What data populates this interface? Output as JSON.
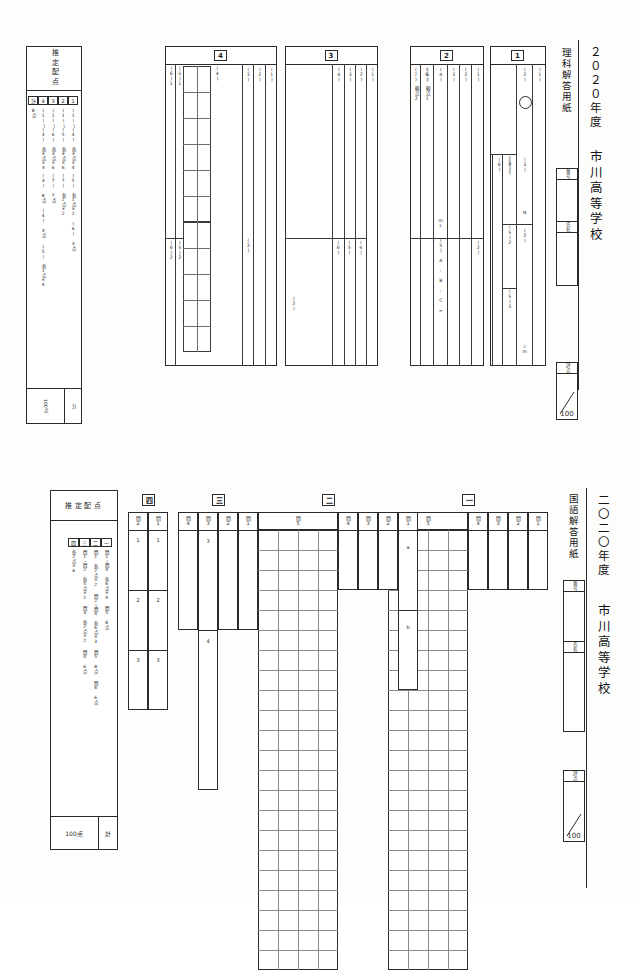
{
  "meta": {
    "bg_color": "#fdfdfc",
    "ink_color": "#2b2b2b",
    "rule_color": "#6e6e6e"
  },
  "science_sheet": {
    "year": "２０２０年度",
    "subject_title": "理科解答用紙",
    "school": "市川高等学校",
    "fields": {
      "number_label": "番号",
      "name_label": "氏名",
      "score_label": "評点",
      "score_denominator": "100"
    },
    "haiten": {
      "title": "推定配点",
      "total_label": "計",
      "total_value": "100点",
      "columns": [
        {
          "sec": "1",
          "lines": [
            "(1)～(4)  各3点×4",
            "(5)  各1点×2",
            "(6)  3点"
          ]
        },
        {
          "sec": "2",
          "lines": [
            "(1)～(5)  各3点×6",
            "(7)  各2点×2"
          ]
        },
        {
          "sec": "3",
          "lines": [
            "(1)～(6)  各3点×6",
            "(7)  7点"
          ]
        },
        {
          "sec": "4",
          "lines": [
            "(1)～(3)  各3点×3",
            "(3)  8点",
            "(4)  3点",
            "(5)  各1点×4"
          ]
        },
        {
          "sec": "計",
          "lines": [
            "8点"
          ]
        }
      ]
    },
    "sections": [
      {
        "id": "1",
        "badge": "1",
        "rows": [
          {
            "label": "(1)",
            "sub": []
          },
          {
            "label": "(2)",
            "sub": [],
            "mark": "○"
          },
          {
            "label": "(3)",
            "sub": [],
            "unit": "N"
          },
          {
            "label": "(4)",
            "sub": []
          },
          {
            "label": "(5)",
            "sub": [
              "(5)1",
              "(5)2",
              "(5)3"
            ]
          },
          {
            "label": "(6)",
            "sub": [],
            "unit": "cm"
          }
        ]
      },
      {
        "id": "2",
        "badge": "2",
        "rows": [
          {
            "label": "(1)",
            "sub": []
          },
          {
            "label": "(2)",
            "sub": []
          },
          {
            "label": "(3)",
            "sub": []
          },
          {
            "label": "(4)",
            "sub": [],
            "unit": "mL"
          },
          {
            "label": "(5)",
            "sub": [],
            "formula": "(5) A : B : C ="
          },
          {
            "label": "(6)",
            "sub": []
          },
          {
            "label": "(7)",
            "sub": [
              "観点1",
              "観点2"
            ]
          }
        ]
      },
      {
        "id": "3",
        "badge": "3",
        "rows": [
          {
            "label": "(1)",
            "sub": []
          },
          {
            "label": "(2)",
            "sub": []
          },
          {
            "label": "(3)",
            "sub": []
          },
          {
            "label": "(4)",
            "sub": []
          },
          {
            "label": "(5)",
            "sub": []
          },
          {
            "label": "(6)",
            "sub": []
          },
          {
            "label": "(7)",
            "sub": []
          }
        ]
      },
      {
        "id": "4",
        "badge": "4",
        "rows": [
          {
            "label": "(1)",
            "sub": []
          },
          {
            "label": "(2)",
            "sub": []
          },
          {
            "label": "(3)",
            "sub": []
          },
          {
            "label": "(4)",
            "sub": []
          },
          {
            "label": "(5)1",
            "sub": []
          },
          {
            "label": "(5)2",
            "sub": []
          },
          {
            "label": "(5)3",
            "sub": []
          },
          {
            "label": "(5)4",
            "sub": []
          },
          {
            "label": "(6)1",
            "sub": []
          },
          {
            "label": "(6)2",
            "sub": []
          }
        ]
      }
    ]
  },
  "japanese_sheet": {
    "year": "二〇二〇年度",
    "subject_title": "国語解答用紙",
    "school": "市川高等学校",
    "fields": {
      "number_label": "番号",
      "name_label": "氏名",
      "score_label": "評点",
      "score_denominator": "100"
    },
    "haiten": {
      "title": "推定配点",
      "total_label": "計",
      "total_value": "100点",
      "columns": [
        {
          "sec": "一",
          "lines": [
            "問1～問4  各6点×4",
            "問5  8点"
          ]
        },
        {
          "sec": "二",
          "lines": [
            "問1  各2点×2",
            "問2～問4  各6点×3",
            "問5  8点",
            "問6  6点"
          ]
        },
        {
          "sec": "三",
          "lines": [
            "問1・問2  各5点×2",
            "問3  各2点×2",
            "問4  6点"
          ]
        },
        {
          "sec": "四",
          "lines": [
            "各2点×6"
          ]
        }
      ]
    },
    "sections": [
      {
        "id": "一",
        "badge": "一",
        "columns": [
          {
            "label": "問1",
            "type": "single"
          },
          {
            "label": "問2",
            "type": "single"
          },
          {
            "label": "問3",
            "type": "single"
          },
          {
            "label": "問4",
            "type": "single"
          },
          {
            "label": "問5",
            "type": "grid",
            "cols": 4,
            "rows": 22
          }
        ]
      },
      {
        "id": "二",
        "badge": "二",
        "columns": [
          {
            "label": "問1",
            "type": "ab",
            "markers": [
              "a",
              "b"
            ]
          },
          {
            "label": "問2",
            "type": "single"
          },
          {
            "label": "問3",
            "type": "single"
          },
          {
            "label": "問4",
            "type": "single"
          },
          {
            "label": "問5",
            "type": "grid",
            "cols": 4,
            "rows": 22
          },
          {
            "label": "問6",
            "type": "single"
          }
        ]
      },
      {
        "id": "三",
        "badge": "三",
        "columns": [
          {
            "label": "問1",
            "type": "single"
          },
          {
            "label": "問2",
            "type": "single"
          },
          {
            "label": "問3",
            "type": "numbered",
            "markers": [
              "3"
            ]
          },
          {
            "label": "問4",
            "type": "numbered",
            "markers": [
              "4"
            ]
          }
        ]
      },
      {
        "id": "四",
        "badge": "四",
        "columns": [
          {
            "label": "問1",
            "type": "numbered3",
            "markers": [
              "1",
              "2",
              "3"
            ]
          },
          {
            "label": "問2",
            "type": "numbered3",
            "markers": [
              "1",
              "2",
              "3"
            ]
          }
        ]
      }
    ]
  }
}
